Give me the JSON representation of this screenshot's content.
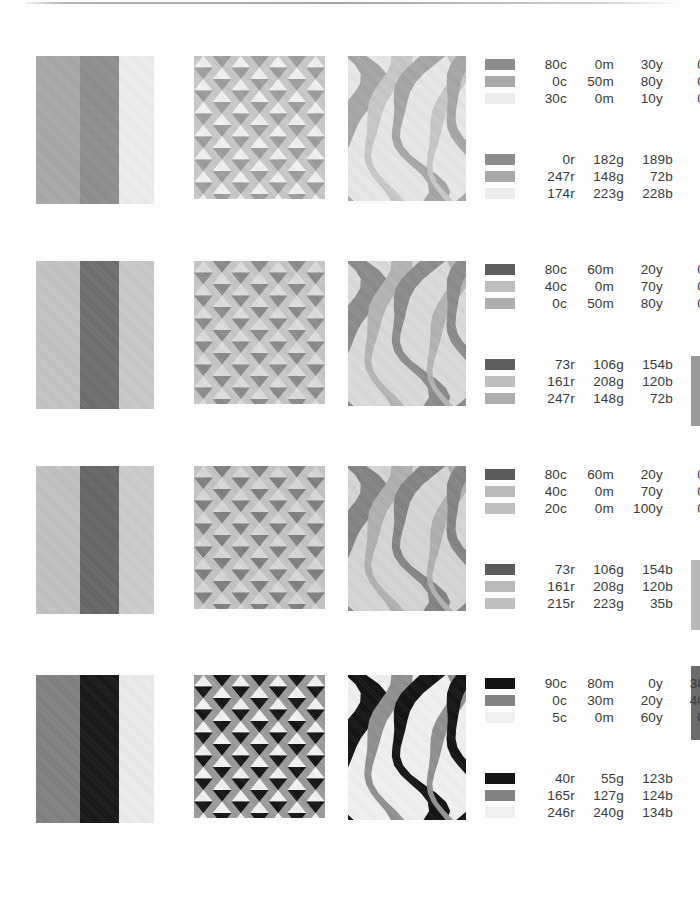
{
  "document": {
    "kind": "color-palette-reference-sheet",
    "background_color": "#fdfdfd",
    "text_color": "#3a3a3a"
  },
  "edge_tabs": [
    {
      "name": "edge-tab-1",
      "top": 356,
      "height": 70,
      "color": "#9a9a9a"
    },
    {
      "name": "edge-tab-2",
      "top": 560,
      "height": 70,
      "color": "#b9b9b9"
    },
    {
      "name": "edge-tab-3",
      "top": 666,
      "height": 74,
      "color": "#6b6b6b"
    }
  ],
  "rows": [
    {
      "id": "palette-row-1",
      "top": 56,
      "patterns": {
        "stripes": {
          "colors": [
            "#a8a8a8",
            "#8e8e8e",
            "#eeeeee"
          ]
        },
        "triangles": {
          "base": "#c9c9c9",
          "up": "#f2f2f2",
          "down": "#9d9d9d"
        },
        "flame": {
          "background": "#e9e9e9",
          "wave": "#a6a6a6",
          "accent": "#c8c8c8"
        }
      },
      "cmyk": {
        "top_offset": 0,
        "lines": [
          {
            "chip": "#8d8d8d",
            "c": "80c",
            "m": "0m",
            "y": "30y",
            "k": "0k"
          },
          {
            "chip": "#a9a9a9",
            "c": "0c",
            "m": "50m",
            "y": "80y",
            "k": "0k"
          },
          {
            "chip": "#ededed",
            "c": "30c",
            "m": "0m",
            "y": "10y",
            "k": "0k"
          }
        ]
      },
      "rgb": {
        "top_offset": 95,
        "lines": [
          {
            "chip": "#8d8d8d",
            "r": "0r",
            "g": "182g",
            "b": "189b"
          },
          {
            "chip": "#a9a9a9",
            "r": "247r",
            "g": "148g",
            "b": "72b"
          },
          {
            "chip": "#ededed",
            "r": "174r",
            "g": "223g",
            "b": "228b"
          }
        ]
      }
    },
    {
      "id": "palette-row-2",
      "top": 261,
      "patterns": {
        "stripes": {
          "colors": [
            "#c4c4c4",
            "#6d6d6d",
            "#c9c9c9"
          ]
        },
        "triangles": {
          "base": "#c7c7c7",
          "up": "#dedede",
          "down": "#8a8a8a"
        },
        "flame": {
          "background": "#dcdcdc",
          "wave": "#8b8b8b",
          "accent": "#b4b4b4"
        }
      },
      "cmyk": {
        "top_offset": 0,
        "lines": [
          {
            "chip": "#5e5e5e",
            "c": "80c",
            "m": "60m",
            "y": "20y",
            "k": "0k"
          },
          {
            "chip": "#bdbdbd",
            "c": "40c",
            "m": "0m",
            "y": "70y",
            "k": "0k"
          },
          {
            "chip": "#aeaeae",
            "c": "0c",
            "m": "50m",
            "y": "80y",
            "k": "0k"
          }
        ]
      },
      "rgb": {
        "top_offset": 95,
        "lines": [
          {
            "chip": "#5e5e5e",
            "r": "73r",
            "g": "106g",
            "b": "154b"
          },
          {
            "chip": "#bdbdbd",
            "r": "161r",
            "g": "208g",
            "b": "120b"
          },
          {
            "chip": "#aeaeae",
            "r": "247r",
            "g": "148g",
            "b": "72b"
          }
        ]
      }
    },
    {
      "id": "palette-row-3",
      "top": 466,
      "patterns": {
        "stripes": {
          "colors": [
            "#c2c2c2",
            "#656565",
            "#cdcdcd"
          ]
        },
        "triangles": {
          "base": "#c4c4c4",
          "up": "#d8d8d8",
          "down": "#7e7e7e"
        },
        "flame": {
          "background": "#d6d6d6",
          "wave": "#838383",
          "accent": "#b0b0b0"
        }
      },
      "cmyk": {
        "top_offset": 0,
        "lines": [
          {
            "chip": "#5b5b5b",
            "c": "80c",
            "m": "60m",
            "y": "20y",
            "k": "0k"
          },
          {
            "chip": "#bbbbbb",
            "c": "40c",
            "m": "0m",
            "y": "70y",
            "k": "0k"
          },
          {
            "chip": "#c0c0c0",
            "c": "20c",
            "m": "0m",
            "y": "100y",
            "k": "0k"
          }
        ]
      },
      "rgb": {
        "top_offset": 95,
        "lines": [
          {
            "chip": "#5b5b5b",
            "r": "73r",
            "g": "106g",
            "b": "154b"
          },
          {
            "chip": "#bbbbbb",
            "r": "161r",
            "g": "208g",
            "b": "120b"
          },
          {
            "chip": "#c0c0c0",
            "r": "215r",
            "g": "223g",
            "b": "35b"
          }
        ]
      }
    },
    {
      "id": "palette-row-4",
      "top": 675,
      "patterns": {
        "stripes": {
          "colors": [
            "#808080",
            "#141414",
            "#ededed"
          ]
        },
        "triangles": {
          "base": "#9a9a9a",
          "up": "#f4f4f4",
          "down": "#111111"
        },
        "flame": {
          "background": "#f2f2f2",
          "wave": "#101010",
          "accent": "#8f8f8f"
        }
      },
      "cmyk": {
        "top_offset": 0,
        "lines": [
          {
            "chip": "#141414",
            "c": "90c",
            "m": "80m",
            "y": "0y",
            "k": "30k"
          },
          {
            "chip": "#828282",
            "c": "0c",
            "m": "30m",
            "y": "20y",
            "k": "40k"
          },
          {
            "chip": "#f0f0f0",
            "c": "5c",
            "m": "0m",
            "y": "60y",
            "k": "0k"
          }
        ]
      },
      "rgb": {
        "top_offset": 95,
        "lines": [
          {
            "chip": "#141414",
            "r": "40r",
            "g": "55g",
            "b": "123b"
          },
          {
            "chip": "#828282",
            "r": "165r",
            "g": "127g",
            "b": "124b"
          },
          {
            "chip": "#f0f0f0",
            "r": "246r",
            "g": "240g",
            "b": "134b"
          }
        ]
      }
    }
  ]
}
